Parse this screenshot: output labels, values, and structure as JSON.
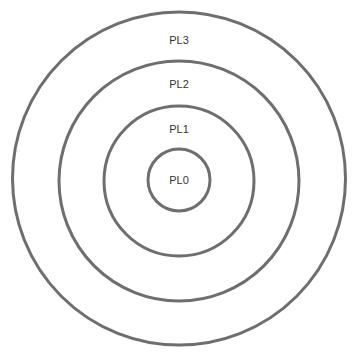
{
  "diagram": {
    "type": "concentric-circles",
    "stroke_color": "#6e6e6e",
    "text_color": "#333333",
    "levels": [
      {
        "id": "pl0",
        "label": "PL0"
      },
      {
        "id": "pl1",
        "label": "PL1"
      },
      {
        "id": "pl2",
        "label": "PL2"
      },
      {
        "id": "pl3",
        "label": "PL3"
      }
    ]
  }
}
